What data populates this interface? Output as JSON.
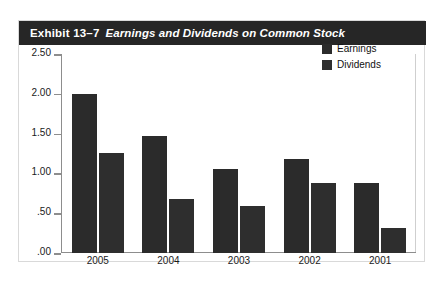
{
  "card": {
    "exhibit_label": "Exhibit 13–7",
    "exhibit_title": "Earnings and Dividends on Common Stock"
  },
  "chart_data": {
    "type": "bar",
    "title": "Earnings and Dividends on Common Stock",
    "xlabel": "",
    "ylabel": "",
    "categories": [
      "2005",
      "2004",
      "2003",
      "2002",
      "2001"
    ],
    "series": [
      {
        "name": "Earnings",
        "color": "#2b2b2b",
        "values": [
          2.0,
          1.47,
          1.05,
          1.18,
          0.88
        ]
      },
      {
        "name": "Dividends",
        "color": "#2e2e2e",
        "values": [
          1.26,
          0.68,
          0.59,
          0.88,
          0.32
        ]
      }
    ],
    "ylim": [
      0,
      2.5
    ],
    "yticks": [
      2.5,
      2.0,
      1.5,
      1.0,
      0.5,
      0.0
    ],
    "ytick_labels": [
      "2.50",
      "2.00",
      "1.50",
      "1.00",
      ".50",
      ".00"
    ],
    "grid": false,
    "legend_position": "top-right"
  }
}
